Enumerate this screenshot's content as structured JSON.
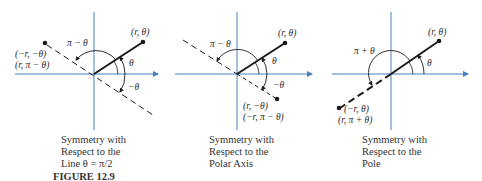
{
  "figure_label": "FIGURE 12.9",
  "colors": {
    "axis": "#4a7fc1",
    "ray": "#1a1a1a",
    "text": "#2a2a2a"
  },
  "panels": [
    {
      "id": "line-theta-pi-over-2",
      "point_label": "(r, θ)",
      "reflected_labels": [
        "(−r, −θ)",
        "(r, π − θ)"
      ],
      "angle_labels": {
        "theta": "θ",
        "neg_theta": "−θ",
        "supplement": "π − θ"
      },
      "caption": [
        "Symmetry with",
        "Respect to the",
        "Line θ = π/2"
      ]
    },
    {
      "id": "polar-axis",
      "point_label": "(r, θ)",
      "reflected_labels": [
        "(r, −θ)",
        "(−r, π − θ)"
      ],
      "angle_labels": {
        "theta": "θ",
        "neg_theta": "−θ",
        "supplement": "π − θ"
      },
      "caption": [
        "Symmetry with",
        "Respect to the",
        "Polar Axis"
      ]
    },
    {
      "id": "pole",
      "point_label": "(r, θ)",
      "reflected_labels": [
        "(−r, θ)",
        "(r, π + θ)"
      ],
      "angle_labels": {
        "theta": "θ",
        "sum": "π + θ"
      },
      "caption": [
        "Symmetry with",
        "Respect to the",
        "Pole"
      ]
    }
  ]
}
